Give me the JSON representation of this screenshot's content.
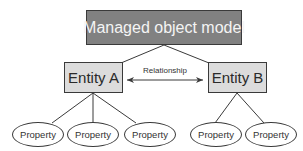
{
  "diagram": {
    "root": {
      "label": "Managed object model"
    },
    "relationship": {
      "label": "Relationship",
      "direction": "bidirectional"
    },
    "entities": [
      {
        "label": "Entity A",
        "properties": [
          "Property",
          "Property",
          "Property"
        ]
      },
      {
        "label": "Entity B",
        "properties": [
          "Property",
          "Property"
        ]
      }
    ],
    "colors": {
      "root_fill": "#818181",
      "root_text": "#f4f4f4",
      "entity_fill": "#dcdcdc",
      "stroke": "#3a3a3a",
      "background": "#ffffff"
    }
  }
}
